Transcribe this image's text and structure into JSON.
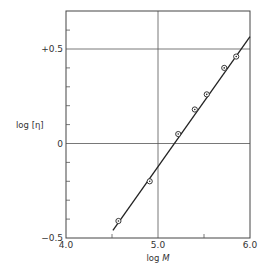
{
  "chart_data": {
    "type": "scatter",
    "title": "",
    "xlabel": "log M",
    "xlabel_parts": {
      "prefix": "log ",
      "var": "M"
    },
    "ylabel": "log [η]",
    "xlim": [
      4.0,
      6.0
    ],
    "ylim": [
      -0.5,
      0.7
    ],
    "x_ticks": [
      {
        "value": 4.0,
        "label": "4.0"
      },
      {
        "value": 5.0,
        "label": "5.0"
      },
      {
        "value": 6.0,
        "label": "6.0"
      }
    ],
    "x_minor_ticks": [
      4.5,
      5.5
    ],
    "y_ticks": [
      {
        "value": -0.5,
        "label": "−0.5"
      },
      {
        "value": 0.0,
        "label": "0"
      },
      {
        "value": 0.5,
        "label": "+0.5"
      }
    ],
    "y_minor_ticks": [
      -0.4,
      -0.3,
      -0.2,
      -0.1,
      0.1,
      0.2,
      0.3,
      0.4,
      0.6
    ],
    "grid": {
      "x": [
        5.0
      ],
      "y": [
        0.0,
        0.5
      ]
    },
    "series": [
      {
        "name": "measured",
        "marker": "dotted-circle",
        "points": [
          {
            "x": 4.57,
            "y": -0.41
          },
          {
            "x": 4.91,
            "y": -0.2
          },
          {
            "x": 5.22,
            "y": 0.05
          },
          {
            "x": 5.4,
            "y": 0.18
          },
          {
            "x": 5.53,
            "y": 0.26
          },
          {
            "x": 5.72,
            "y": 0.4
          },
          {
            "x": 5.85,
            "y": 0.46
          }
        ]
      },
      {
        "name": "fit",
        "type": "line",
        "points": [
          {
            "x": 4.51,
            "y": -0.46
          },
          {
            "x": 6.0,
            "y": 0.565
          }
        ]
      }
    ],
    "colors": {
      "ink": "#222222",
      "grid": "#555555"
    }
  }
}
